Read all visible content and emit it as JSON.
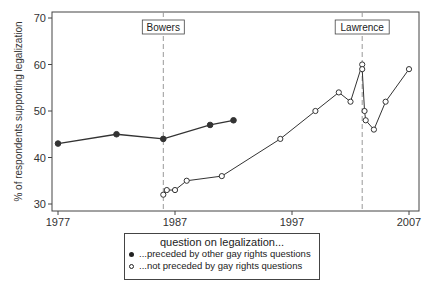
{
  "chart_data": {
    "type": "line",
    "title": "",
    "xlabel": "",
    "ylabel": "% of respondents supporting legalization",
    "xlim": [
      1977,
      2007
    ],
    "ylim": [
      30,
      70
    ],
    "x_ticks": [
      "1977",
      "1987",
      "1997",
      "2007"
    ],
    "y_ticks": [
      "30",
      "40",
      "50",
      "60",
      "70"
    ],
    "grid": false,
    "legend_position": "bottom",
    "legend_title": "question on legalization...",
    "annotations": [
      {
        "label": "Bowers",
        "x": 1986,
        "style": "dashed vertical line"
      },
      {
        "label": "Lawrence",
        "x": 2003,
        "style": "dashed vertical line"
      }
    ],
    "series": [
      {
        "name": "...preceded by other gay rights questions",
        "marker": "filled-circle",
        "x": [
          1977,
          1982,
          1986,
          1990,
          1992
        ],
        "values": [
          43,
          45,
          44,
          47,
          48
        ]
      },
      {
        "name": "...not preceded by gay rights questions",
        "marker": "open-circle",
        "x": [
          1986,
          1986.3,
          1987,
          1988,
          1991,
          1996,
          1999,
          2001,
          2002,
          2003,
          2003,
          2003.2,
          2003.3,
          2004,
          2005,
          2007
        ],
        "values": [
          32,
          33,
          33,
          35,
          36,
          44,
          50,
          54,
          52,
          60,
          59,
          50,
          48,
          46,
          52,
          59
        ]
      }
    ]
  },
  "legend": {
    "title": "question on legalization...",
    "items": [
      {
        "label": "...preceded by other gay rights questions",
        "marker": "filled"
      },
      {
        "label": "...not preceded by gay rights questions",
        "marker": "open"
      }
    ]
  }
}
